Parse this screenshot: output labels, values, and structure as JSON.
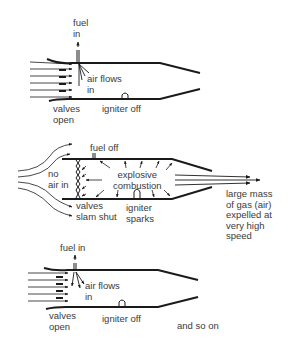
{
  "diagram": {
    "type": "pulse-jet engine cycle",
    "colors": {
      "ink": "#1a1a1a",
      "text": "#3a3a3a",
      "background": "#ffffff"
    },
    "panels": [
      {
        "id": "intake",
        "labels": {
          "fuel": "fuel\nin",
          "air": "air flows\nin",
          "valves": "valves\nopen",
          "igniter": "igniter off"
        }
      },
      {
        "id": "combustion",
        "labels": {
          "fuel": "fuel off",
          "no_air": "no\nair in",
          "combustion": "explosive\ncombustion",
          "valves": "valves\nslam shut",
          "igniter": "igniter\nsparks",
          "exhaust": "large mass\nof gas (air)\nexpelled at\nvery high\nspeed"
        }
      },
      {
        "id": "repeat",
        "labels": {
          "fuel": "fuel in",
          "air": "air flows\nin",
          "valves": "valves\nopen",
          "igniter": "igniter off",
          "continue": "and so on"
        }
      }
    ]
  }
}
